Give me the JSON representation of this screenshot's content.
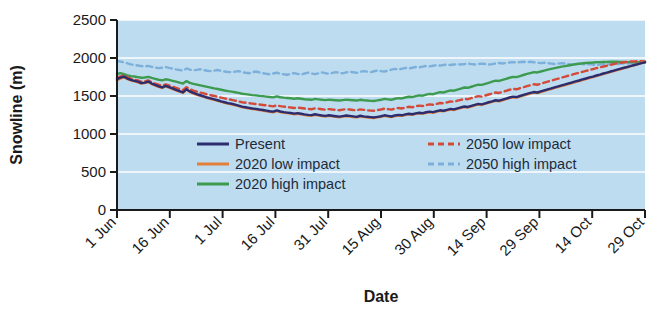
{
  "chart_data": {
    "type": "line",
    "title": "",
    "xlabel": "Date",
    "ylabel": "Snowline (m)",
    "ylim": [
      0,
      2500
    ],
    "yticks": [
      0,
      500,
      1000,
      1500,
      2000,
      2500
    ],
    "ytick_labels": [
      "0",
      "500",
      "1000",
      "1500",
      "2000",
      "2500"
    ],
    "xtick_labels": [
      "1 Jun",
      "16 Jun",
      "1 Jul",
      "16 Jul",
      "31 Jul",
      "15 Aug",
      "30 Aug",
      "14 Sep",
      "29 Sep",
      "14 Oct",
      "29 Oct"
    ],
    "x_tick_day_index": [
      0,
      15,
      30,
      45,
      60,
      75,
      90,
      105,
      120,
      135,
      150
    ],
    "x_range_days": [
      0,
      150
    ],
    "grid": "horizontal-white",
    "plot_background": "#bedcf0",
    "legend_position": "inside-bottom-center",
    "series": [
      {
        "name": "Present",
        "color": "#2c2c6e",
        "style": "solid",
        "values": [
          1720,
          1742,
          1755,
          1730,
          1712,
          1700,
          1688,
          1670,
          1676,
          1690,
          1664,
          1645,
          1628,
          1612,
          1634,
          1618,
          1600,
          1582,
          1565,
          1548,
          1590,
          1560,
          1540,
          1524,
          1510,
          1496,
          1480,
          1468,
          1456,
          1444,
          1430,
          1418,
          1406,
          1398,
          1386,
          1374,
          1360,
          1352,
          1344,
          1336,
          1330,
          1322,
          1316,
          1308,
          1300,
          1294,
          1310,
          1296,
          1288,
          1282,
          1276,
          1268,
          1274,
          1266,
          1258,
          1252,
          1248,
          1260,
          1252,
          1244,
          1238,
          1246,
          1240,
          1234,
          1228,
          1236,
          1244,
          1238,
          1232,
          1226,
          1240,
          1232,
          1226,
          1222,
          1218,
          1226,
          1234,
          1246,
          1238,
          1230,
          1244,
          1252,
          1246,
          1258,
          1266,
          1260,
          1272,
          1280,
          1274,
          1286,
          1294,
          1288,
          1300,
          1312,
          1306,
          1318,
          1330,
          1324,
          1338,
          1350,
          1362,
          1356,
          1370,
          1384,
          1396,
          1390,
          1404,
          1418,
          1430,
          1444,
          1438,
          1452,
          1466,
          1480,
          1492,
          1486,
          1500,
          1514,
          1528,
          1540,
          1552,
          1546,
          1560,
          1574,
          1588,
          1600,
          1614,
          1626,
          1640,
          1652,
          1666,
          1678,
          1692,
          1704,
          1718,
          1730,
          1744,
          1756,
          1770,
          1782,
          1796,
          1808,
          1822,
          1834,
          1848,
          1860,
          1872,
          1884,
          1896,
          1908,
          1920,
          1932,
          1944
        ]
      },
      {
        "name": "2020 low impact",
        "color": "#e2803a",
        "style": "solid",
        "values": [
          1706,
          1730,
          1748,
          1722,
          1704,
          1692,
          1680,
          1662,
          1670,
          1684,
          1656,
          1638,
          1620,
          1604,
          1628,
          1610,
          1592,
          1574,
          1558,
          1540,
          1584,
          1552,
          1532,
          1516,
          1502,
          1488,
          1472,
          1460,
          1448,
          1436,
          1422,
          1410,
          1398,
          1390,
          1378,
          1366,
          1352,
          1344,
          1336,
          1328,
          1322,
          1314,
          1308,
          1300,
          1292,
          1286,
          1302,
          1288,
          1280,
          1274,
          1268,
          1260,
          1266,
          1258,
          1250,
          1244,
          1240,
          1252,
          1244,
          1236,
          1230,
          1238,
          1232,
          1226,
          1220,
          1228,
          1236,
          1230,
          1224,
          1218,
          1232,
          1224,
          1218,
          1214,
          1210,
          1218,
          1226,
          1238,
          1230,
          1222,
          1236,
          1244,
          1238,
          1250,
          1258,
          1252,
          1264,
          1272,
          1266,
          1278,
          1286,
          1280,
          1292,
          1304,
          1298,
          1310,
          1322,
          1316,
          1330,
          1342,
          1354,
          1348,
          1362,
          1376,
          1388,
          1382,
          1396,
          1410,
          1422,
          1436,
          1430,
          1444,
          1458,
          1472,
          1484,
          1478,
          1492,
          1506,
          1520,
          1532,
          1544,
          1538,
          1552,
          1566,
          1580,
          1592,
          1606,
          1618,
          1632,
          1644,
          1658,
          1670,
          1684,
          1696,
          1710,
          1722,
          1736,
          1748,
          1762,
          1774,
          1788,
          1800,
          1814,
          1826,
          1840,
          1852,
          1866,
          1878,
          1892,
          1906,
          1920,
          1936,
          1952
        ]
      },
      {
        "name": "2020 high impact",
        "color": "#3d9b4f",
        "style": "solid",
        "values": [
          1790,
          1800,
          1786,
          1772,
          1762,
          1756,
          1748,
          1740,
          1744,
          1752,
          1738,
          1726,
          1714,
          1706,
          1720,
          1712,
          1700,
          1688,
          1676,
          1664,
          1696,
          1672,
          1660,
          1650,
          1640,
          1630,
          1620,
          1610,
          1600,
          1592,
          1582,
          1572,
          1564,
          1558,
          1550,
          1542,
          1530,
          1524,
          1518,
          1512,
          1508,
          1502,
          1498,
          1492,
          1486,
          1482,
          1496,
          1484,
          1478,
          1474,
          1470,
          1464,
          1470,
          1464,
          1458,
          1454,
          1450,
          1462,
          1456,
          1450,
          1446,
          1452,
          1448,
          1444,
          1440,
          1446,
          1452,
          1448,
          1444,
          1440,
          1450,
          1444,
          1440,
          1436,
          1434,
          1442,
          1450,
          1462,
          1456,
          1450,
          1464,
          1472,
          1468,
          1480,
          1490,
          1486,
          1498,
          1508,
          1504,
          1518,
          1528,
          1524,
          1538,
          1550,
          1546,
          1560,
          1574,
          1570,
          1584,
          1598,
          1612,
          1608,
          1622,
          1636,
          1650,
          1646,
          1660,
          1674,
          1688,
          1702,
          1698,
          1712,
          1726,
          1740,
          1752,
          1748,
          1762,
          1776,
          1790,
          1802,
          1814,
          1810,
          1822,
          1834,
          1846,
          1856,
          1866,
          1876,
          1886,
          1894,
          1902,
          1910,
          1918,
          1924,
          1930,
          1934,
          1938,
          1940,
          1944,
          1946,
          1948,
          1948,
          1950,
          1950,
          1950,
          1948,
          1948,
          1946,
          1946,
          1944,
          1944,
          1944,
          1944
        ]
      },
      {
        "name": "2050 low impact",
        "color": "#d44a38",
        "style": "dashed",
        "values": [
          1736,
          1758,
          1770,
          1746,
          1728,
          1716,
          1704,
          1688,
          1694,
          1706,
          1682,
          1664,
          1648,
          1634,
          1654,
          1640,
          1624,
          1608,
          1592,
          1578,
          1616,
          1590,
          1572,
          1558,
          1546,
          1534,
          1520,
          1510,
          1500,
          1490,
          1478,
          1468,
          1458,
          1450,
          1440,
          1430,
          1418,
          1412,
          1406,
          1400,
          1394,
          1388,
          1382,
          1376,
          1370,
          1364,
          1378,
          1366,
          1360,
          1354,
          1348,
          1342,
          1348,
          1342,
          1336,
          1330,
          1326,
          1338,
          1332,
          1326,
          1320,
          1328,
          1322,
          1318,
          1312,
          1320,
          1328,
          1322,
          1316,
          1312,
          1324,
          1318,
          1312,
          1308,
          1306,
          1314,
          1322,
          1334,
          1328,
          1320,
          1334,
          1342,
          1336,
          1348,
          1358,
          1352,
          1364,
          1374,
          1368,
          1380,
          1390,
          1384,
          1396,
          1408,
          1404,
          1416,
          1428,
          1424,
          1438,
          1450,
          1462,
          1458,
          1472,
          1486,
          1498,
          1492,
          1506,
          1520,
          1532,
          1546,
          1540,
          1554,
          1568,
          1582,
          1594,
          1588,
          1602,
          1616,
          1630,
          1642,
          1654,
          1648,
          1662,
          1676,
          1690,
          1702,
          1716,
          1728,
          1742,
          1754,
          1768,
          1780,
          1794,
          1806,
          1818,
          1830,
          1842,
          1854,
          1866,
          1876,
          1888,
          1898,
          1910,
          1920,
          1930,
          1938,
          1944,
          1950,
          1954,
          1956,
          1958,
          1958,
          1956
        ]
      },
      {
        "name": "2050 high impact",
        "color": "#7cb0db",
        "style": "dashed",
        "values": [
          1960,
          1952,
          1944,
          1930,
          1916,
          1908,
          1902,
          1894,
          1888,
          1896,
          1884,
          1874,
          1866,
          1872,
          1882,
          1870,
          1860,
          1850,
          1842,
          1834,
          1862,
          1846,
          1838,
          1844,
          1852,
          1840,
          1832,
          1826,
          1834,
          1842,
          1830,
          1822,
          1816,
          1812,
          1820,
          1828,
          1814,
          1806,
          1800,
          1812,
          1822,
          1810,
          1800,
          1792,
          1786,
          1796,
          1806,
          1794,
          1786,
          1780,
          1792,
          1802,
          1790,
          1782,
          1796,
          1808,
          1796,
          1788,
          1798,
          1810,
          1800,
          1792,
          1804,
          1814,
          1806,
          1798,
          1810,
          1820,
          1812,
          1806,
          1818,
          1828,
          1820,
          1814,
          1826,
          1836,
          1828,
          1822,
          1834,
          1846,
          1856,
          1848,
          1858,
          1870,
          1862,
          1872,
          1882,
          1876,
          1886,
          1896,
          1890,
          1898,
          1906,
          1900,
          1908,
          1914,
          1908,
          1914,
          1920,
          1914,
          1920,
          1926,
          1920,
          1914,
          1920,
          1926,
          1920,
          1914,
          1920,
          1928,
          1934,
          1928,
          1934,
          1940,
          1946,
          1940,
          1946,
          1950,
          1944,
          1950,
          1944,
          1938,
          1932,
          1938,
          1932,
          1926,
          1920,
          1926,
          1932,
          1926,
          1920,
          1914,
          1920,
          1926,
          1920,
          1914,
          1920,
          1914,
          1908,
          1914,
          1920,
          1914,
          1920,
          1926,
          1920,
          1926,
          1932,
          1926,
          1932,
          1938,
          1932,
          1938,
          1944
        ]
      }
    ]
  },
  "legend": {
    "items": [
      {
        "label": "Present",
        "color": "#2c2c6e",
        "style": "solid"
      },
      {
        "label": "2020 low impact",
        "color": "#e2803a",
        "style": "solid"
      },
      {
        "label": "2020 high impact",
        "color": "#3d9b4f",
        "style": "solid"
      },
      {
        "label": "2050 low impact",
        "color": "#d44a38",
        "style": "dashed"
      },
      {
        "label": "2050 high impact",
        "color": "#7cb0db",
        "style": "dashed"
      }
    ]
  }
}
